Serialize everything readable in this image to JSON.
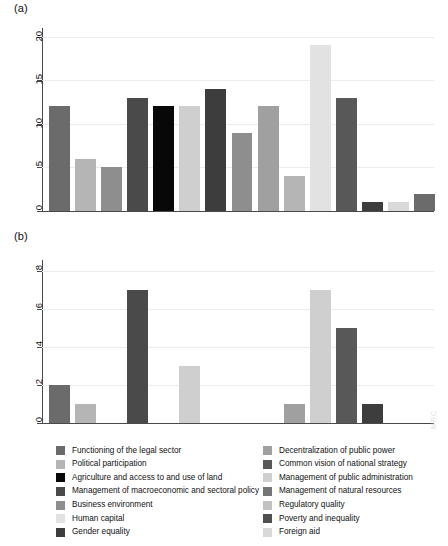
{
  "figure": {
    "panel_a_label": "(a)",
    "panel_b_label": "(b)"
  },
  "legend": {
    "left": [
      {
        "label": "Functioning of the legal sector",
        "color": "#6b6b6b"
      },
      {
        "label": "Political participation",
        "color": "#b5b5b5"
      },
      {
        "label": "Agriculture and access to and use of land",
        "color": "#080808"
      },
      {
        "label": "Management of macroeconomic and sectoral policy",
        "color": "#4a4a4a"
      },
      {
        "label": "Business environment",
        "color": "#8e8e8e"
      },
      {
        "label": "Human capital",
        "color": "#e2e2e2"
      },
      {
        "label": "Gender equality",
        "color": "#3d3d3d"
      }
    ],
    "right": [
      {
        "label": "Decentralization of public power",
        "color": "#a0a0a0"
      },
      {
        "label": "Common vision of national strategy",
        "color": "#585858"
      },
      {
        "label": "Management of public administration",
        "color": "#cfcfcf"
      },
      {
        "label": "Management of natural resources",
        "color": "#757575"
      },
      {
        "label": "Regulatory quality",
        "color": "#c2c2c2"
      },
      {
        "label": "Poverty and inequality",
        "color": "#4f4f4f"
      },
      {
        "label": "Foreign aid",
        "color": "#d9d9d9"
      }
    ]
  },
  "chart_data": [
    {
      "id": "a",
      "type": "bar",
      "title": "(a)",
      "xlabel": "",
      "ylabel": "",
      "ylim": [
        0,
        21
      ],
      "yticks": [
        0,
        5,
        10,
        15,
        20
      ],
      "ytick_labels": [
        "0",
        "5",
        "10",
        "15",
        "20"
      ],
      "grid": true,
      "legend_position": "below-figure",
      "categories": [
        "Functioning of the legal sector",
        "Political participation",
        "Agriculture and access to and use of land",
        "Management of macroeconomic and sectoral policy",
        "Business environment",
        "Human capital",
        "Gender equality",
        "Decentralization of public power",
        "Common vision of national strategy",
        "Management of public administration",
        "Management of natural resources",
        "Regulatory quality",
        "Poverty and inequality",
        "Foreign aid"
      ],
      "values": [
        12,
        6,
        5,
        13,
        12,
        12,
        14,
        9,
        12,
        4,
        19,
        13,
        1,
        1
      ],
      "extra_bar": {
        "value": 2,
        "color": "#6b6b6b"
      },
      "colors": [
        "#6b6b6b",
        "#b5b5b5",
        "#8e8e8e",
        "#4a4a4a",
        "#080808",
        "#cfcfcf",
        "#3d3d3d",
        "#8e8e8e",
        "#a0a0a0",
        "#b5b5b5",
        "#e2e2e2",
        "#585858",
        "#3d3d3d",
        "#d9d9d9"
      ]
    },
    {
      "id": "b",
      "type": "bar",
      "title": "(b)",
      "xlabel": "",
      "ylabel": "",
      "ylim": [
        0,
        8.6
      ],
      "yticks": [
        0,
        2,
        4,
        6,
        8
      ],
      "ytick_labels": [
        "0",
        "2",
        "4",
        "6",
        "8"
      ],
      "grid": true,
      "legend_position": "below-figure",
      "categories": [
        "Functioning of the legal sector",
        "Political participation",
        "Agriculture and access to and use of land",
        "Management of macroeconomic and sectoral policy",
        "Business environment",
        "Human capital",
        "Gender equality",
        "Decentralization of public power",
        "Common vision of national strategy",
        "Management of public administration",
        "Management of natural resources",
        "Regulatory quality",
        "Poverty and inequality",
        "Foreign aid"
      ],
      "values": [
        2,
        1,
        0,
        7,
        0,
        3,
        0,
        0,
        0,
        1,
        7,
        5,
        1,
        0
      ],
      "colors": [
        "#6b6b6b",
        "#b5b5b5",
        "#8e8e8e",
        "#4a4a4a",
        "#080808",
        "#cfcfcf",
        "#3d3d3d",
        "#8e8e8e",
        "#a0a0a0",
        "#a0a0a0",
        "#cfcfcf",
        "#585858",
        "#3d3d3d",
        "#d9d9d9"
      ]
    }
  ]
}
